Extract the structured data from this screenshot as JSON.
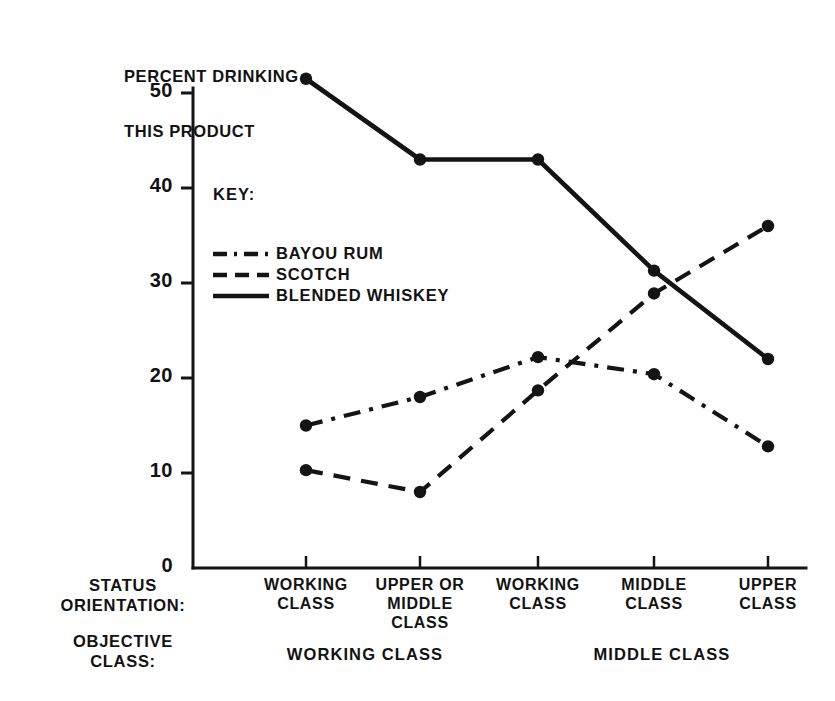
{
  "chart_data": {
    "type": "line",
    "title": "PERCENT DRINKING\nTHIS PRODUCT",
    "ylabel": "PERCENT DRINKING THIS PRODUCT",
    "xlabel": "STATUS ORIENTATION",
    "ylim": [
      0,
      50
    ],
    "yticks": [
      0,
      10,
      20,
      30,
      40,
      50
    ],
    "ytick_labels": [
      "0",
      "10",
      "20",
      "30",
      "40",
      "50"
    ],
    "grid": false,
    "legend_position": "upper-left-inside",
    "legend_title": "KEY:",
    "categories": [
      "WORKING\nCLASS",
      "UPPER OR\nMIDDLE\nCLASS",
      "WORKING\nCLASS",
      "MIDDLE\nCLASS",
      "UPPER\nCLASS"
    ],
    "series": [
      {
        "name": "BAYOU RUM",
        "style": "dashdot",
        "color": "#141414",
        "values": [
          15.0,
          18.0,
          22.2,
          20.4,
          12.8
        ]
      },
      {
        "name": "SCOTCH",
        "style": "dashed",
        "color": "#141414",
        "values": [
          10.3,
          8.0,
          18.7,
          28.9,
          36.0
        ]
      },
      {
        "name": "BLENDED WHISKEY",
        "style": "solid",
        "color": "#141414",
        "values": [
          51.5,
          43.0,
          43.0,
          31.3,
          22.0
        ]
      }
    ],
    "group_axis_label": "OBJECTIVE\nCLASS:",
    "status_axis_label": "STATUS\nORIENTATION:",
    "groups": [
      {
        "label": "WORKING CLASS",
        "categories": [
          0,
          1
        ]
      },
      {
        "label": "MIDDLE CLASS",
        "categories": [
          2,
          3,
          4
        ]
      }
    ]
  },
  "axis_title_line1": "PERCENT DRINKING",
  "axis_title_line2": "THIS PRODUCT",
  "yticks": [
    "50",
    "40",
    "30",
    "20",
    "10",
    "0"
  ],
  "legend": {
    "title": "KEY:",
    "items": [
      {
        "label": "BAYOU RUM",
        "style": "dashdot"
      },
      {
        "label": "SCOTCH",
        "style": "dashed"
      },
      {
        "label": "BLENDED WHISKEY",
        "style": "solid"
      }
    ]
  },
  "xlabels": [
    "WORKING\nCLASS",
    "UPPER OR\nMIDDLE\nCLASS",
    "WORKING\nCLASS",
    "MIDDLE\nCLASS",
    "UPPER\nCLASS"
  ],
  "row_labels": {
    "status": "STATUS\nORIENTATION:",
    "objective": "OBJECTIVE\nCLASS:"
  },
  "group_labels": [
    "WORKING CLASS",
    "MIDDLE CLASS"
  ],
  "colors": {
    "ink": "#141414",
    "background": "#ffffff"
  }
}
